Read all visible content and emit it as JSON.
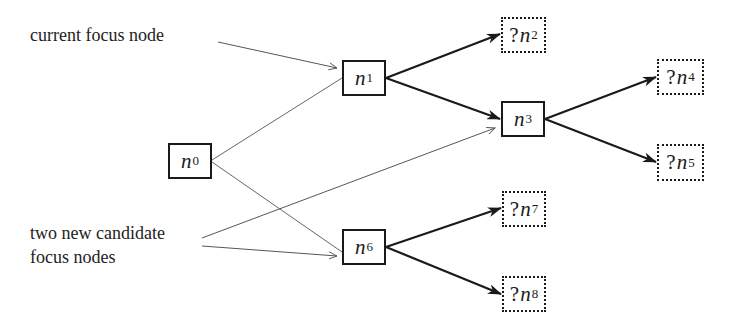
{
  "annotations": {
    "current_focus": "current focus node",
    "candidates_line1": "two new candidate",
    "candidates_line2": "focus nodes"
  },
  "nodes": [
    {
      "id": "n0",
      "var": "n",
      "sub": "0",
      "unknown": false,
      "x": 168,
      "y": 143,
      "w": 44,
      "h": 36
    },
    {
      "id": "n1",
      "var": "n",
      "sub": "1",
      "unknown": false,
      "x": 342,
      "y": 60,
      "w": 44,
      "h": 36
    },
    {
      "id": "n2",
      "var": "n",
      "sub": "2",
      "unknown": true,
      "prefix": "?",
      "x": 501,
      "y": 17,
      "w": 45,
      "h": 36
    },
    {
      "id": "n3",
      "var": "n",
      "sub": "3",
      "unknown": false,
      "x": 501,
      "y": 101,
      "w": 44,
      "h": 36
    },
    {
      "id": "n4",
      "var": "n",
      "sub": "4",
      "unknown": true,
      "prefix": "?",
      "x": 657,
      "y": 59,
      "w": 47,
      "h": 36
    },
    {
      "id": "n5",
      "var": "n",
      "sub": "5",
      "unknown": true,
      "prefix": "?",
      "x": 657,
      "y": 144,
      "w": 47,
      "h": 37
    },
    {
      "id": "n6",
      "var": "n",
      "sub": "6",
      "unknown": false,
      "x": 342,
      "y": 229,
      "w": 44,
      "h": 36
    },
    {
      "id": "n7",
      "var": "n",
      "sub": "7",
      "unknown": true,
      "prefix": "?",
      "x": 502,
      "y": 191,
      "w": 44,
      "h": 36
    },
    {
      "id": "n8",
      "var": "n",
      "sub": "8",
      "unknown": true,
      "prefix": "?",
      "x": 502,
      "y": 276,
      "w": 44,
      "h": 36
    }
  ],
  "edges": [
    {
      "from": "n0",
      "to": "n1",
      "style": "thin"
    },
    {
      "from": "n0",
      "to": "n6",
      "style": "thin"
    },
    {
      "from": "n1",
      "to": "n2",
      "style": "bold-arrow"
    },
    {
      "from": "n1",
      "to": "n3",
      "style": "bold-arrow"
    },
    {
      "from": "n3",
      "to": "n4",
      "style": "bold-arrow"
    },
    {
      "from": "n3",
      "to": "n5",
      "style": "bold-arrow"
    },
    {
      "from": "n6",
      "to": "n7",
      "style": "bold-arrow"
    },
    {
      "from": "n6",
      "to": "n8",
      "style": "bold-arrow"
    }
  ],
  "pointers": [
    {
      "label": "current focus node",
      "target": "n1"
    },
    {
      "label": "two new candidate focus nodes",
      "target": "n3"
    },
    {
      "label": "two new candidate focus nodes",
      "target": "n6"
    }
  ],
  "colors": {
    "ink": "#1a1a1a",
    "thin_line": "#555555",
    "background": "#ffffff"
  }
}
